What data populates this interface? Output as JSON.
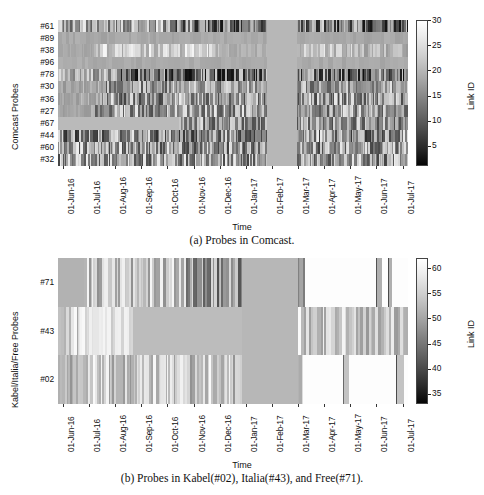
{
  "figure": {
    "kind": "two-panel grayscale heatmap figure",
    "background": "#ffffff"
  },
  "chart_data": [
    {
      "id": "panel-a",
      "type": "heatmap",
      "title": "",
      "caption": "(a) Probes in Comcast.",
      "xlabel": "Time",
      "ylabel": "Comcast Probes",
      "colorbar_label": "Link ID",
      "colormap": "gray",
      "colorbar_ticks": [
        5,
        10,
        15,
        20,
        25,
        30
      ],
      "colorbar_range": [
        1,
        30
      ],
      "xticklabels": [
        "01-Jun-16",
        "01-Jul-16",
        "01-Aug-16",
        "01-Sep-16",
        "01-Oct-16",
        "01-Nov-16",
        "01-Dec-16",
        "01-Jan-17",
        "01-Feb-17",
        "01-Mar-17",
        "01-Apr-17",
        "01-May-17",
        "01-Jun-17",
        "01-Jul-17"
      ],
      "yticklabels": [
        "#61",
        "#89",
        "#38",
        "#96",
        "#78",
        "#30",
        "#36",
        "#27",
        "#67",
        "#44",
        "#60",
        "#32"
      ],
      "missing_data_gap": "01-Feb-17 to 01-Mar-17",
      "rows": [
        {
          "label": "#61",
          "mean_link_id": 22,
          "activity": "high-contrast dense stripes across full range"
        },
        {
          "label": "#89",
          "mean_link_id": 17,
          "activity": "near-uniform mid gray, low variance"
        },
        {
          "label": "#38",
          "mean_link_id": 9,
          "activity": "light banding mid-2016, sparse late"
        },
        {
          "label": "#96",
          "mean_link_id": 17,
          "activity": "near-uniform mid gray"
        },
        {
          "label": "#78",
          "mean_link_id": 21,
          "activity": "dark dense stripes from Aug-16"
        },
        {
          "label": "#30",
          "mean_link_id": 15,
          "activity": "moderate striping throughout"
        },
        {
          "label": "#36",
          "mean_link_id": 16,
          "activity": "moderate striping, dark clusters"
        },
        {
          "label": "#27",
          "mean_link_id": 14,
          "activity": "variable light/dark striping"
        },
        {
          "label": "#67",
          "mean_link_id": 16,
          "activity": "flat light band Jun-16 to Oct-16 then striped"
        },
        {
          "label": "#44",
          "mean_link_id": 19,
          "activity": "dark striping, heavy mid-2016"
        },
        {
          "label": "#60",
          "mean_link_id": 17,
          "activity": "dense mixed striping"
        },
        {
          "label": "#32",
          "mean_link_id": 16,
          "activity": "dense mixed striping"
        }
      ]
    },
    {
      "id": "panel-b",
      "type": "heatmap",
      "title": "",
      "caption": "(b) Probes in Kabel(#02), Italia(#43), and Free(#71).",
      "xlabel": "Time",
      "ylabel": "Kabel/Italia/Free Probes",
      "colorbar_label": "Link ID",
      "colormap": "gray",
      "colorbar_ticks": [
        35,
        40,
        45,
        50,
        55,
        60
      ],
      "colorbar_range": [
        33,
        62
      ],
      "xticklabels": [
        "01-Jun-16",
        "01-Jul-16",
        "01-Aug-16",
        "01-Sep-16",
        "01-Oct-16",
        "01-Nov-16",
        "01-Dec-16",
        "01-Jan-17",
        "01-Feb-17",
        "01-Mar-17",
        "01-Apr-17",
        "01-May-17",
        "01-Jun-17",
        "01-Jul-17"
      ],
      "yticklabels": [
        "#71",
        "#43",
        "#02"
      ],
      "missing_data_gap": "01-Jan-17 to 01-Mar-17",
      "rows": [
        {
          "label": "#71",
          "mean_link_id": 52,
          "activity": "dark striping 2016, mostly white after Mar-17"
        },
        {
          "label": "#43",
          "mean_link_id": 46,
          "activity": "light banding with dark clusters, flat Aug-16 to Dec-16"
        },
        {
          "label": "#02",
          "mean_link_id": 49,
          "activity": "dense striping 2016, near-white sparse after Mar-17"
        }
      ]
    }
  ]
}
